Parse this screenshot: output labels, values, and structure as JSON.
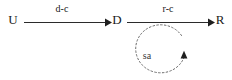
{
  "diagram": {
    "title": "",
    "background_color": "#ffffff",
    "ink_color": "#1a1a1a",
    "dashed_color": "#6b6b6b",
    "nodes": [
      {
        "id": "U",
        "label": "U",
        "x": 13,
        "y": 21
      },
      {
        "id": "D",
        "label": "D",
        "x": 117,
        "y": 21
      },
      {
        "id": "R",
        "label": "R",
        "x": 220,
        "y": 21
      }
    ],
    "edges": [
      {
        "id": "u-to-d",
        "from": "U",
        "to": "D",
        "label": "d-c",
        "label_x": 62,
        "label_y": 9,
        "style": "solid",
        "arrow": "end",
        "x1": 24,
        "x2": 108,
        "y": 22
      },
      {
        "id": "d-to-r",
        "from": "D",
        "to": "R",
        "label": "r-c",
        "label_x": 168,
        "label_y": 9,
        "style": "solid",
        "arrow": "end",
        "x1": 127,
        "x2": 211,
        "y": 22
      }
    ],
    "loops": [
      {
        "id": "sa-feedback-loop",
        "label": "sa",
        "label_x": 147,
        "label_y": 57,
        "style": "dashed",
        "direction": "counterclockwise",
        "center_x": 162,
        "center_y": 50,
        "radius_x": 25,
        "radius_y": 24,
        "arrow": "end",
        "arrow_x": 184,
        "arrow_y": 55
      }
    ]
  }
}
